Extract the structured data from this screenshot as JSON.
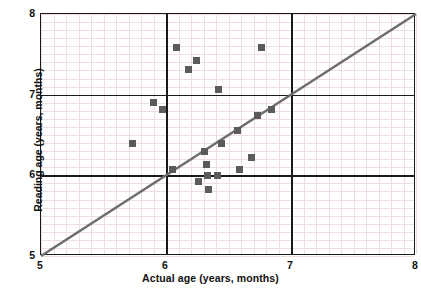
{
  "chart_data": {
    "type": "scatter",
    "title": "",
    "xlabel": "Actual age (years, months)",
    "ylabel": "Reading age (years, months)",
    "xlim": [
      5,
      8
    ],
    "ylim": [
      5,
      8
    ],
    "xticks": [
      "5",
      "6",
      "7",
      "8"
    ],
    "yticks": [
      "5",
      "6",
      "7",
      "8"
    ],
    "xtick_values": [
      5,
      6,
      7,
      8
    ],
    "ytick_values": [
      5,
      6,
      7,
      8
    ],
    "grid": "minor gridlines every 0.1, major black gridlines at integers",
    "legend": "none",
    "marker": "square",
    "marker_color": "#5b5b5b",
    "reference_line": {
      "name": "y = x line",
      "from": [
        5,
        5
      ],
      "to": [
        8,
        8
      ],
      "color": "#6e6e6e"
    },
    "points": [
      {
        "x": 5.73,
        "y": 6.4
      },
      {
        "x": 5.9,
        "y": 6.9
      },
      {
        "x": 5.97,
        "y": 6.82
      },
      {
        "x": 6.05,
        "y": 6.07
      },
      {
        "x": 6.08,
        "y": 7.58
      },
      {
        "x": 6.18,
        "y": 7.31
      },
      {
        "x": 6.24,
        "y": 7.42
      },
      {
        "x": 6.26,
        "y": 5.92
      },
      {
        "x": 6.31,
        "y": 6.3
      },
      {
        "x": 6.32,
        "y": 6.13
      },
      {
        "x": 6.33,
        "y": 6.0
      },
      {
        "x": 6.34,
        "y": 5.83
      },
      {
        "x": 6.41,
        "y": 6.0
      },
      {
        "x": 6.42,
        "y": 7.06
      },
      {
        "x": 6.44,
        "y": 6.39
      },
      {
        "x": 6.57,
        "y": 6.56
      },
      {
        "x": 6.59,
        "y": 6.07
      },
      {
        "x": 6.68,
        "y": 6.22
      },
      {
        "x": 6.73,
        "y": 6.74
      },
      {
        "x": 6.76,
        "y": 7.58
      },
      {
        "x": 6.84,
        "y": 6.82
      }
    ]
  },
  "axis": {
    "x_label": "Actual age (years, months)",
    "y_label": "Reading age (years, months)"
  }
}
